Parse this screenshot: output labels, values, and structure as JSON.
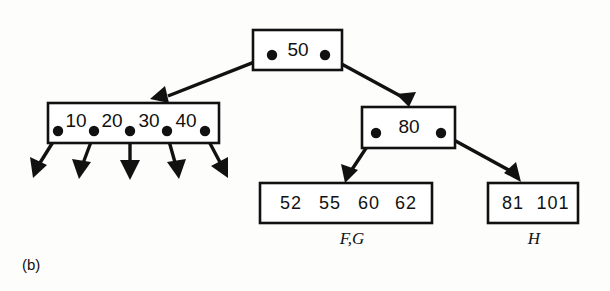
{
  "figure": {
    "caption": "(b)",
    "type": "b-tree-diagram"
  },
  "nodes": {
    "root": {
      "name": "root-node",
      "keys": [
        "50"
      ],
      "pointer_count": 2
    },
    "internal_left": {
      "name": "internal-node-left",
      "keys": [
        "10",
        "20",
        "30",
        "40"
      ],
      "pointer_count": 5
    },
    "internal_right": {
      "name": "internal-node-right",
      "keys": [
        "80"
      ],
      "pointer_count": 2
    },
    "leaf_left": {
      "name": "leaf-node-left",
      "keys": [
        "52",
        "55",
        "60",
        "62"
      ],
      "label": "F,G"
    },
    "leaf_right": {
      "name": "leaf-node-right",
      "keys": [
        "81",
        "101"
      ],
      "label": "H"
    }
  },
  "colors": {
    "ink": "#111111",
    "paper": "#fdfdfc",
    "node_fill": "#ffffff"
  }
}
